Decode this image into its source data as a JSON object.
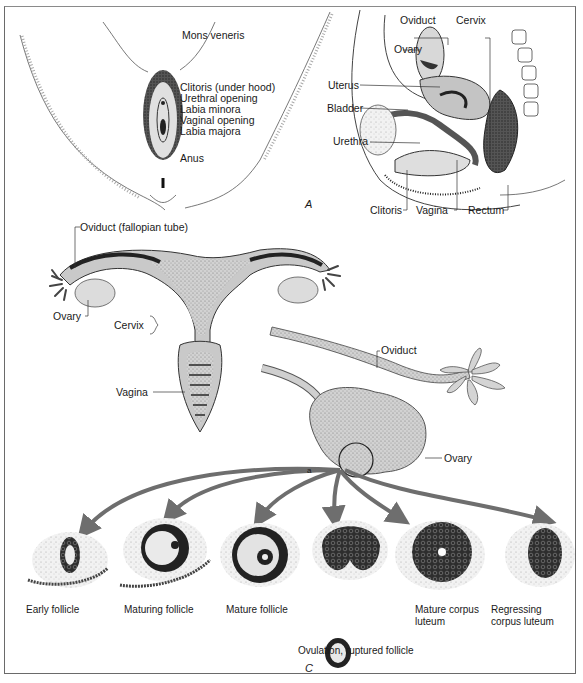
{
  "figure": {
    "top_note": "Human reproductive system",
    "panels": [
      "A",
      "B",
      "C"
    ]
  },
  "panel_a_external": {
    "labels": [
      "Mons veneris",
      "Clitoris (under hood)",
      "Urethral opening",
      "Labia minora",
      "Vaginal opening",
      "Labia majora",
      "Anus"
    ],
    "panel_letter": "A"
  },
  "panel_a_sagittal": {
    "labels": {
      "oviduct": "Oviduct",
      "cervix": "Cervix",
      "ovary": "Ovary",
      "uterus": "Uterus",
      "bladder": "Bladder",
      "urethra": "Urethra",
      "clitoris": "Clitoris",
      "vagina": "Vagina",
      "rectum": "Rectum"
    }
  },
  "panel_b_uterus": {
    "labels": {
      "oviduct": "Oviduct (fallopian tube)",
      "ovary": "Ovary",
      "cervix": "Cervix",
      "vagina": "Vagina"
    }
  },
  "panel_c_ovary": {
    "labels": {
      "oviduct": "Oviduct",
      "ovary": "Ovary",
      "marker": "a"
    },
    "stages": [
      "Early follicle",
      "Maturing follicle",
      "Mature follicle",
      "Ovulation, ruptured follicle",
      "Mature corpus luteum",
      "Regressing corpus luteum"
    ],
    "panel_letter": "C"
  },
  "colors": {
    "tissue_gray": "#c9c9c9",
    "dark_tissue": "#3a3a3a",
    "arrow_gray": "#6e6e6e",
    "frame": "#6a6a6a"
  }
}
